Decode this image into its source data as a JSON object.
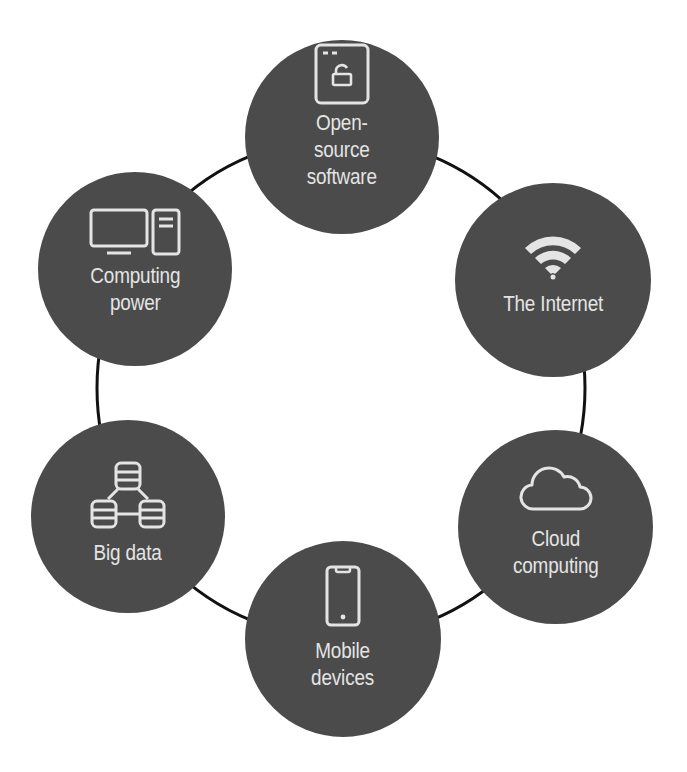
{
  "diagram": {
    "type": "cycle",
    "colors": {
      "node_fill": "#4b4b4b",
      "node_text": "#e4e4e4",
      "ring_stroke": "#111111",
      "background": "#ffffff"
    },
    "nodes": [
      {
        "id": "open-source",
        "icon": "browser-unlock-icon",
        "label_lines": [
          "Open-",
          "source",
          "software"
        ]
      },
      {
        "id": "internet",
        "icon": "wifi-icon",
        "label_lines": [
          "The Internet"
        ]
      },
      {
        "id": "cloud",
        "icon": "cloud-icon",
        "label_lines": [
          "Cloud",
          "computing"
        ]
      },
      {
        "id": "mobile",
        "icon": "smartphone-icon",
        "label_lines": [
          "Mobile",
          "devices"
        ]
      },
      {
        "id": "big-data",
        "icon": "database-network-icon",
        "label_lines": [
          "Big data"
        ]
      },
      {
        "id": "computing",
        "icon": "desktop-computer-icon",
        "label_lines": [
          "Computing",
          "power"
        ]
      }
    ]
  }
}
